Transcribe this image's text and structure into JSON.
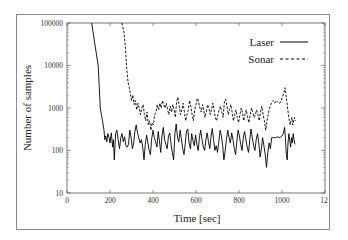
{
  "chart_data": {
    "type": "line",
    "title": "",
    "xlabel": "Time [sec]",
    "ylabel": "Number of samples",
    "xlim": [
      0,
      1200
    ],
    "ylim": [
      10,
      100000
    ],
    "yscale": "log",
    "grid": false,
    "legend_position": "top-right",
    "x_ticks": [
      "0",
      "200",
      "400",
      "600",
      "800",
      "1000",
      "12"
    ],
    "y_ticks": [
      "10",
      "100",
      "1000",
      "10000",
      "100000"
    ],
    "series": [
      {
        "name": "Laser",
        "style": "solid",
        "color": "#000000",
        "points": [
          [
            115,
            100000
          ],
          [
            130,
            30000
          ],
          [
            145,
            10000
          ],
          [
            150,
            3000
          ],
          [
            155,
            1000
          ],
          [
            160,
            700
          ],
          [
            165,
            500
          ],
          [
            172,
            300
          ],
          [
            176,
            180
          ],
          [
            180,
            220
          ],
          [
            185,
            160
          ],
          [
            190,
            250
          ],
          [
            196,
            200
          ],
          [
            200,
            150
          ],
          [
            206,
            260
          ],
          [
            212,
            120
          ],
          [
            216,
            180
          ],
          [
            220,
            60
          ],
          [
            226,
            250
          ],
          [
            232,
            300
          ],
          [
            238,
            180
          ],
          [
            244,
            110
          ],
          [
            250,
            200
          ],
          [
            256,
            250
          ],
          [
            262,
            160
          ],
          [
            268,
            210
          ],
          [
            274,
            130
          ],
          [
            280,
            120
          ],
          [
            286,
            140
          ],
          [
            292,
            300
          ],
          [
            298,
            200
          ],
          [
            304,
            110
          ],
          [
            310,
            150
          ],
          [
            316,
            280
          ],
          [
            322,
            400
          ],
          [
            328,
            260
          ],
          [
            334,
            200
          ],
          [
            340,
            150
          ],
          [
            346,
            180
          ],
          [
            352,
            120
          ],
          [
            358,
            60
          ],
          [
            364,
            140
          ],
          [
            370,
            230
          ],
          [
            376,
            160
          ],
          [
            382,
            100
          ],
          [
            388,
            80
          ],
          [
            394,
            190
          ],
          [
            400,
            300
          ],
          [
            406,
            200
          ],
          [
            412,
            160
          ],
          [
            418,
            120
          ],
          [
            424,
            280
          ],
          [
            430,
            170
          ],
          [
            436,
            90
          ],
          [
            442,
            220
          ],
          [
            448,
            350
          ],
          [
            454,
            180
          ],
          [
            460,
            140
          ],
          [
            466,
            110
          ],
          [
            472,
            220
          ],
          [
            478,
            260
          ],
          [
            484,
            140
          ],
          [
            490,
            90
          ],
          [
            496,
            60
          ],
          [
            502,
            250
          ],
          [
            508,
            420
          ],
          [
            514,
            200
          ],
          [
            520,
            160
          ],
          [
            526,
            300
          ],
          [
            532,
            190
          ],
          [
            538,
            110
          ],
          [
            544,
            80
          ],
          [
            550,
            150
          ],
          [
            556,
            290
          ],
          [
            562,
            320
          ],
          [
            568,
            150
          ],
          [
            574,
            110
          ],
          [
            580,
            250
          ],
          [
            586,
            170
          ],
          [
            592,
            130
          ],
          [
            598,
            230
          ],
          [
            604,
            140
          ],
          [
            610,
            100
          ],
          [
            616,
            200
          ],
          [
            622,
            300
          ],
          [
            628,
            180
          ],
          [
            634,
            120
          ],
          [
            640,
            100
          ],
          [
            646,
            180
          ],
          [
            652,
            260
          ],
          [
            658,
            160
          ],
          [
            664,
            110
          ],
          [
            670,
            220
          ],
          [
            676,
            330
          ],
          [
            682,
            180
          ],
          [
            688,
            100
          ],
          [
            694,
            130
          ],
          [
            700,
            90
          ],
          [
            706,
            160
          ],
          [
            712,
            300
          ],
          [
            718,
            220
          ],
          [
            724,
            130
          ],
          [
            730,
            60
          ],
          [
            736,
            100
          ],
          [
            742,
            190
          ],
          [
            748,
            300
          ],
          [
            754,
            200
          ],
          [
            760,
            150
          ],
          [
            766,
            260
          ],
          [
            772,
            180
          ],
          [
            778,
            110
          ],
          [
            784,
            80
          ],
          [
            790,
            160
          ],
          [
            796,
            300
          ],
          [
            802,
            220
          ],
          [
            808,
            140
          ],
          [
            814,
            100
          ],
          [
            820,
            200
          ],
          [
            826,
            280
          ],
          [
            832,
            180
          ],
          [
            838,
            120
          ],
          [
            844,
            90
          ],
          [
            850,
            180
          ],
          [
            856,
            320
          ],
          [
            862,
            200
          ],
          [
            868,
            130
          ],
          [
            874,
            100
          ],
          [
            880,
            180
          ],
          [
            886,
            250
          ],
          [
            892,
            150
          ],
          [
            898,
            70
          ],
          [
            904,
            110
          ],
          [
            910,
            200
          ],
          [
            916,
            130
          ],
          [
            922,
            80
          ],
          [
            928,
            40
          ],
          [
            934,
            90
          ],
          [
            940,
            150
          ],
          [
            946,
            110
          ],
          [
            952,
            200
          ],
          [
            960,
            200
          ],
          [
            970,
            200
          ],
          [
            980,
            210
          ],
          [
            990,
            200
          ],
          [
            1000,
            220
          ],
          [
            1006,
            250
          ],
          [
            1012,
            350
          ],
          [
            1016,
            200
          ],
          [
            1020,
            80
          ],
          [
            1024,
            60
          ],
          [
            1028,
            150
          ],
          [
            1032,
            250
          ],
          [
            1036,
            180
          ],
          [
            1040,
            120
          ],
          [
            1044,
            200
          ],
          [
            1048,
            150
          ],
          [
            1052,
            250
          ],
          [
            1056,
            180
          ],
          [
            1060,
            140
          ]
        ]
      },
      {
        "name": "Sonar",
        "style": "dashed",
        "color": "#000000",
        "points": [
          [
            255,
            100000
          ],
          [
            265,
            60000
          ],
          [
            272,
            25000
          ],
          [
            278,
            8000
          ],
          [
            284,
            4000
          ],
          [
            290,
            3000
          ],
          [
            295,
            2200
          ],
          [
            300,
            1500
          ],
          [
            306,
            2000
          ],
          [
            312,
            1200
          ],
          [
            318,
            1500
          ],
          [
            324,
            900
          ],
          [
            330,
            1300
          ],
          [
            336,
            1000
          ],
          [
            342,
            700
          ],
          [
            348,
            1000
          ],
          [
            354,
            1200
          ],
          [
            360,
            700
          ],
          [
            366,
            500
          ],
          [
            372,
            800
          ],
          [
            378,
            400
          ],
          [
            384,
            500
          ],
          [
            390,
            300
          ],
          [
            396,
            450
          ],
          [
            402,
            400
          ],
          [
            408,
            700
          ],
          [
            414,
            800
          ],
          [
            420,
            1200
          ],
          [
            426,
            900
          ],
          [
            432,
            1300
          ],
          [
            438,
            1000
          ],
          [
            444,
            1500
          ],
          [
            450,
            1200
          ],
          [
            456,
            1000
          ],
          [
            462,
            1300
          ],
          [
            468,
            900
          ],
          [
            474,
            700
          ],
          [
            480,
            1100
          ],
          [
            486,
            800
          ],
          [
            492,
            1200
          ],
          [
            498,
            900
          ],
          [
            504,
            600
          ],
          [
            510,
            1400
          ],
          [
            516,
            1800
          ],
          [
            522,
            1100
          ],
          [
            528,
            700
          ],
          [
            534,
            900
          ],
          [
            540,
            1300
          ],
          [
            546,
            800
          ],
          [
            552,
            500
          ],
          [
            558,
            700
          ],
          [
            564,
            900
          ],
          [
            570,
            1500
          ],
          [
            576,
            1100
          ],
          [
            582,
            700
          ],
          [
            588,
            500
          ],
          [
            594,
            900
          ],
          [
            600,
            1200
          ],
          [
            606,
            1700
          ],
          [
            612,
            1400
          ],
          [
            618,
            1000
          ],
          [
            624,
            800
          ],
          [
            630,
            1200
          ],
          [
            636,
            900
          ],
          [
            642,
            600
          ],
          [
            648,
            800
          ],
          [
            654,
            1200
          ],
          [
            660,
            1000
          ],
          [
            666,
            700
          ],
          [
            672,
            900
          ],
          [
            678,
            1300
          ],
          [
            684,
            900
          ],
          [
            690,
            600
          ],
          [
            696,
            500
          ],
          [
            702,
            700
          ],
          [
            708,
            900
          ],
          [
            714,
            1100
          ],
          [
            720,
            800
          ],
          [
            726,
            600
          ],
          [
            732,
            1400
          ],
          [
            738,
            1600
          ],
          [
            744,
            1100
          ],
          [
            750,
            700
          ],
          [
            756,
            900
          ],
          [
            762,
            1200
          ],
          [
            768,
            800
          ],
          [
            774,
            500
          ],
          [
            780,
            700
          ],
          [
            786,
            900
          ],
          [
            792,
            600
          ],
          [
            798,
            450
          ],
          [
            804,
            700
          ],
          [
            810,
            1000
          ],
          [
            816,
            800
          ],
          [
            822,
            500
          ],
          [
            828,
            700
          ],
          [
            834,
            900
          ],
          [
            840,
            600
          ],
          [
            846,
            450
          ],
          [
            852,
            700
          ],
          [
            858,
            1000
          ],
          [
            864,
            800
          ],
          [
            870,
            600
          ],
          [
            876,
            700
          ],
          [
            882,
            900
          ],
          [
            888,
            700
          ],
          [
            894,
            500
          ],
          [
            900,
            800
          ],
          [
            906,
            1100
          ],
          [
            912,
            700
          ],
          [
            918,
            500
          ],
          [
            924,
            300
          ],
          [
            930,
            500
          ],
          [
            936,
            700
          ],
          [
            942,
            1000
          ],
          [
            948,
            1200
          ],
          [
            954,
            1400
          ],
          [
            960,
            1500
          ],
          [
            966,
            1300
          ],
          [
            972,
            1500
          ],
          [
            978,
            1400
          ],
          [
            984,
            1300
          ],
          [
            990,
            1300
          ],
          [
            996,
            1500
          ],
          [
            1002,
            1800
          ],
          [
            1008,
            2200
          ],
          [
            1014,
            3000
          ],
          [
            1018,
            2200
          ],
          [
            1022,
            1500
          ],
          [
            1026,
            1000
          ],
          [
            1030,
            700
          ],
          [
            1034,
            500
          ],
          [
            1038,
            400
          ],
          [
            1042,
            500
          ],
          [
            1046,
            600
          ],
          [
            1050,
            400
          ],
          [
            1054,
            500
          ],
          [
            1058,
            600
          ],
          [
            1062,
            500
          ]
        ]
      }
    ]
  },
  "legend": {
    "items": [
      {
        "label": "Laser",
        "style": "solid"
      },
      {
        "label": "Sonar",
        "style": "dashed"
      }
    ]
  },
  "axes": {
    "x_title": "Time [sec]",
    "y_title": "Number of samples"
  }
}
